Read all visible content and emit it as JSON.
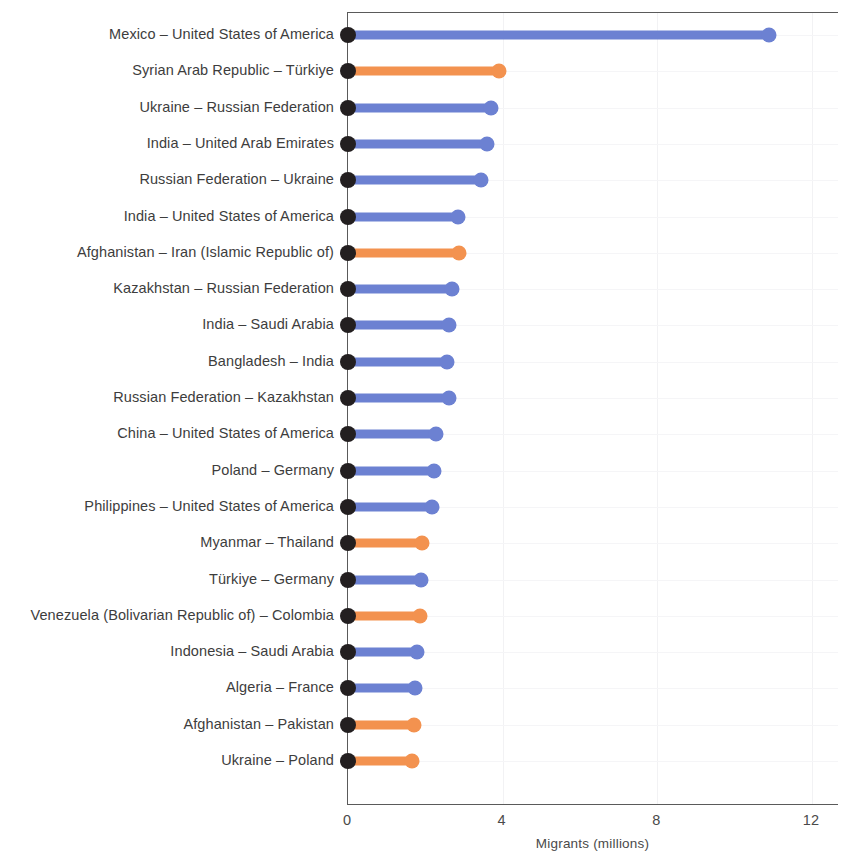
{
  "chart_data": {
    "type": "bar",
    "subtype": "lollipop-horizontal",
    "title": "",
    "xlabel": "Migrants (millions)",
    "ylabel": "",
    "xlim": [
      0,
      12.7
    ],
    "xticks": [
      0,
      4,
      8,
      12
    ],
    "xtick_labels": [
      "0",
      "4",
      "8",
      "12"
    ],
    "grid": "faint",
    "legend": "none",
    "colors": {
      "blue": "#6C81D2",
      "orange": "#F3924F",
      "origin_dot": "#231f20",
      "axis": "#5a5a5a",
      "text": "#3d3d3d",
      "gridline": "#f2f2f4",
      "background": "#ffffff"
    },
    "categories": [
      "Mexico – United States of America",
      "Syrian Arab Republic – Türkiye",
      "Ukraine – Russian Federation",
      "India – United Arab Emirates",
      "Russian Federation – Ukraine",
      "India – United States of America",
      "Afghanistan – Iran (Islamic Republic of)",
      "Kazakhstan – Russian Federation",
      "India – Saudi Arabia",
      "Bangladesh – India",
      "Russian Federation – Kazakhstan",
      "China – United States of America",
      "Poland – Germany",
      "Philippines – United States of America",
      "Myanmar – Thailand",
      "Türkiye – Germany",
      "Venezuela (Bolivarian Republic of) – Colombia",
      "Indonesia – Saudi Arabia",
      "Algeria – France",
      "Afghanistan – Pakistan",
      "Ukraine – Poland"
    ],
    "values": [
      10.9,
      3.9,
      3.7,
      3.6,
      3.45,
      2.85,
      2.88,
      2.7,
      2.6,
      2.56,
      2.6,
      2.28,
      2.23,
      2.18,
      1.92,
      1.89,
      1.87,
      1.79,
      1.74,
      1.71,
      1.66
    ],
    "series_color_keys": [
      "blue",
      "orange",
      "blue",
      "blue",
      "blue",
      "blue",
      "orange",
      "blue",
      "blue",
      "blue",
      "blue",
      "blue",
      "blue",
      "blue",
      "orange",
      "blue",
      "orange",
      "blue",
      "blue",
      "orange",
      "orange"
    ]
  }
}
